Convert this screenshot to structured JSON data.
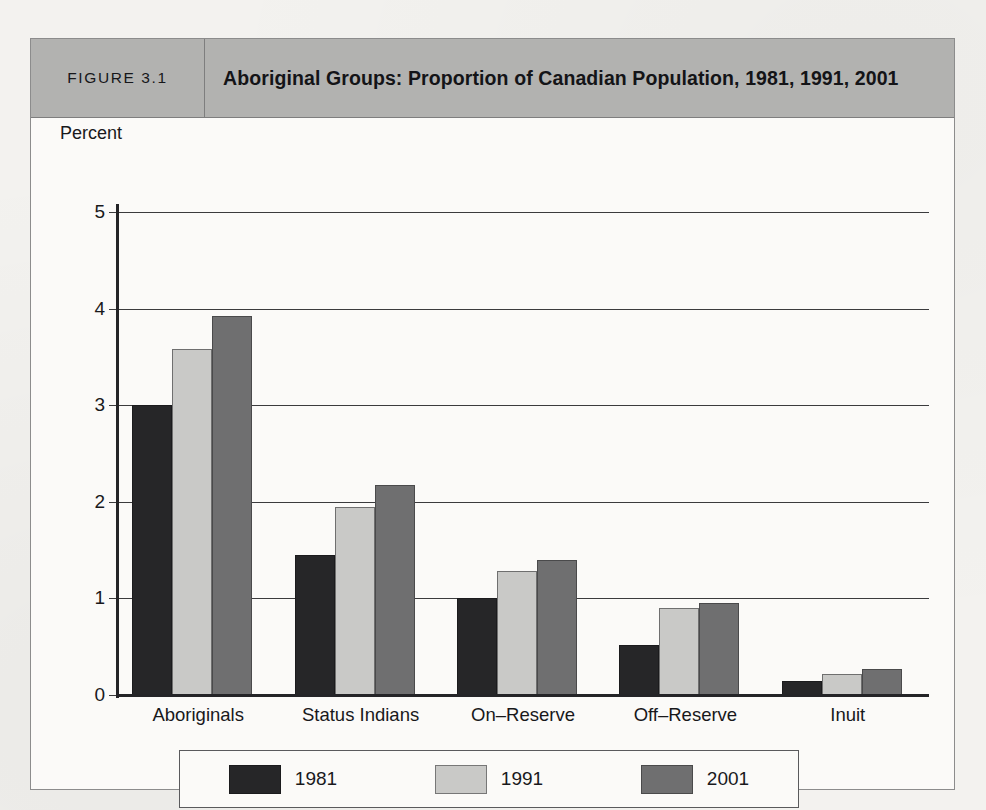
{
  "figure": {
    "number_label": "FIGURE 3.1",
    "title": "Aboriginal Groups: Proportion of Canadian Population, 1981, 1991, 2001"
  },
  "colors": {
    "series_1981": "#262628",
    "series_1991": "#c9c9c7",
    "series_2001": "#6f6f70",
    "header_bg": "#b2b2b0",
    "plot_bg": "#fbfaf8",
    "axis": "#242427",
    "gridline": "#3b3b3d"
  },
  "chart_data": {
    "type": "bar",
    "title": "Aboriginal Groups: Proportion of Canadian Population, 1981, 1991, 2001",
    "xlabel": "",
    "ylabel": "Percent",
    "ylim": [
      0,
      5
    ],
    "yticks": [
      0,
      1,
      2,
      3,
      4,
      5
    ],
    "ytick_labels": [
      "0",
      "1",
      "2",
      "3",
      "4",
      "5"
    ],
    "grid": true,
    "legend_position": "bottom",
    "categories": [
      "Aboriginals",
      "Status Indians",
      "On–Reserve",
      "Off–Reserve",
      "Inuit"
    ],
    "series": [
      {
        "name": "1981",
        "color": "#262628",
        "values": [
          3.0,
          1.45,
          1.0,
          0.52,
          0.15
        ]
      },
      {
        "name": "1991",
        "color": "#c9c9c7",
        "values": [
          3.58,
          1.95,
          1.28,
          0.9,
          0.22
        ]
      },
      {
        "name": "2001",
        "color": "#6f6f70",
        "values": [
          3.92,
          2.17,
          1.4,
          0.95,
          0.27
        ]
      }
    ]
  },
  "legend": {
    "items": [
      {
        "label": "1981",
        "swatch_class": "s1981"
      },
      {
        "label": "1991",
        "swatch_class": "s1991"
      },
      {
        "label": "2001",
        "swatch_class": "s2001"
      }
    ]
  }
}
